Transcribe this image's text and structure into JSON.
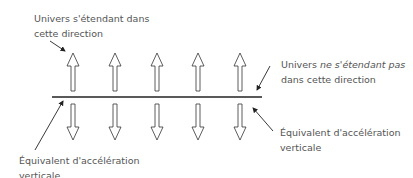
{
  "labels": {
    "top_left": {
      "line1": "Univers s'étendant dans",
      "line2": "cette direction"
    },
    "top_right": {
      "line1_a": "Univers ",
      "line1_b": "ne s'étendant pas",
      "line2": "dans cette direction"
    },
    "bottom_left": {
      "line1": "Équivalent d'accélération",
      "line2": "verticale"
    },
    "bottom_right": {
      "line1": "Équivalent d'accélération",
      "line2": "verticale"
    }
  },
  "diagram": {
    "up_arrow_count": 5,
    "down_arrow_count": 5,
    "arrow_x_positions": [
      73,
      115,
      157,
      198,
      240
    ],
    "line_color": "#222222",
    "text_color": "#555555"
  }
}
